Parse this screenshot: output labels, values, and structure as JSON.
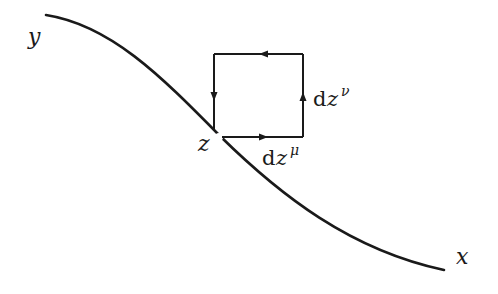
{
  "diagram": {
    "labels": {
      "y_axis": "y",
      "x_axis": "x",
      "point": "z",
      "dz_mu": {
        "d": "d",
        "z": "z",
        "sup": "μ"
      },
      "dz_nu": {
        "d": "d",
        "z": "z",
        "sup": "ν"
      }
    },
    "loop": {
      "direction": "counter-clockwise",
      "edges": [
        "bottom-right",
        "right-up",
        "top-left",
        "left-down"
      ]
    },
    "colors": {
      "stroke": "#1a1a1a",
      "background": "#ffffff"
    }
  }
}
